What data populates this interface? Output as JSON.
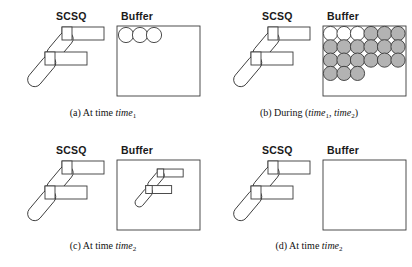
{
  "figure": {
    "panel_count": 4,
    "stroke_color": "#3a3a3a",
    "fill_color": "#ffffff",
    "circle_gray": "#b3b3b3",
    "circle_white": "#ffffff",
    "background": "#ffffff"
  },
  "labels": {
    "scsq": "SCSQ",
    "buffer": "Buffer"
  },
  "panels": [
    {
      "id": "a",
      "tag": "(a)",
      "caption_prefix": "(a) At time ",
      "caption_term": "time",
      "caption_sub": "1",
      "scsq_label": "SCSQ",
      "buffer_label": "Buffer",
      "buffer_contents": "three-empty-circles",
      "circle_rows": [
        {
          "count": 3,
          "fills": [
            "white",
            "white",
            "white"
          ]
        }
      ]
    },
    {
      "id": "b",
      "tag": "(b)",
      "caption_prefix": "(b) During (",
      "caption_term": "time",
      "caption_sub": "1",
      "caption_mid": ", ",
      "caption_term2": "time",
      "caption_sub2": "2",
      "caption_suffix": ")",
      "scsq_label": "SCSQ",
      "buffer_label": "Buffer",
      "buffer_contents": "filled-circle-grid",
      "circle_rows": [
        {
          "count": 6,
          "fills": [
            "white",
            "white",
            "white",
            "gray",
            "gray",
            "gray"
          ]
        },
        {
          "count": 6,
          "fills": [
            "gray",
            "gray",
            "gray",
            "gray",
            "gray",
            "gray"
          ]
        },
        {
          "count": 6,
          "fills": [
            "gray",
            "gray",
            "gray",
            "gray",
            "gray",
            "gray"
          ]
        },
        {
          "count": 3,
          "fills": [
            "gray",
            "gray",
            "gray"
          ]
        }
      ]
    },
    {
      "id": "c",
      "tag": "(c)",
      "caption_prefix": "(c) At time ",
      "caption_term": "time",
      "caption_sub": "2",
      "scsq_label": "SCSQ",
      "buffer_label": "Buffer",
      "buffer_contents": "miniature-robot-arm",
      "circle_rows": []
    },
    {
      "id": "d",
      "tag": "(d)",
      "caption_prefix": "(d) At time ",
      "caption_term": "time",
      "caption_sub": "2",
      "scsq_label": "SCSQ",
      "buffer_label": "Buffer",
      "buffer_contents": "empty",
      "circle_rows": []
    }
  ]
}
